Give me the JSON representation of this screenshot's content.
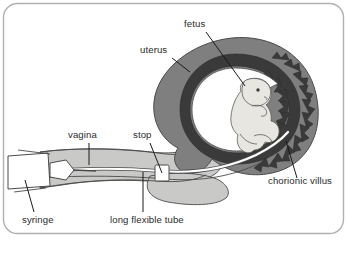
{
  "figure": {
    "frame": {
      "border_color": "#b0b0b0",
      "background_color": "#ffffff",
      "corner_radius": 14
    },
    "palette": {
      "uterus_wall": "#807f80",
      "inner_dark_ring": "#3a3a3a",
      "amniotic_cavity": "#ffffff",
      "fetus_fill": "#e8e6e1",
      "soft_tissue": "#c9c9c7",
      "catheter_white": "#ffffff",
      "outline": "#4a4a4a",
      "label_text": "#2b2b2b",
      "leader_line": "#1a1a1a"
    },
    "labels": [
      {
        "id": "fetus",
        "text": "fetus",
        "text_x": 184,
        "text_y": 27,
        "anchor": "start",
        "leader": {
          "x1": 206,
          "y1": 32,
          "x2": 245,
          "y2": 86
        }
      },
      {
        "id": "uterus",
        "text": "uterus",
        "text_x": 140,
        "text_y": 53,
        "anchor": "start",
        "leader": {
          "x1": 172,
          "y1": 58,
          "x2": 190,
          "y2": 72
        }
      },
      {
        "id": "vagina",
        "text": "vagina",
        "text_x": 68,
        "text_y": 138,
        "anchor": "start",
        "leader": {
          "x1": 89,
          "y1": 143,
          "x2": 89,
          "y2": 165
        }
      },
      {
        "id": "stop",
        "text": "stop",
        "text_x": 133,
        "text_y": 138,
        "anchor": "start",
        "leader": {
          "x1": 150,
          "y1": 143,
          "x2": 162,
          "y2": 173
        }
      },
      {
        "id": "chorionic-villus",
        "text": "chorionic villus",
        "text_x": 268,
        "text_y": 184,
        "anchor": "start",
        "leader": {
          "x1": 297,
          "y1": 178,
          "x2": 286,
          "y2": 141
        }
      },
      {
        "id": "syringe",
        "text": "syringe",
        "text_x": 22,
        "text_y": 223,
        "anchor": "start",
        "leader": {
          "x1": 34,
          "y1": 212,
          "x2": 25,
          "y2": 180
        }
      },
      {
        "id": "long-flexible-tube",
        "text": "long flexible tube",
        "text_x": 110,
        "text_y": 223,
        "anchor": "start",
        "leader": {
          "x1": 143,
          "y1": 212,
          "x2": 143,
          "y2": 172
        }
      }
    ],
    "parts": [
      {
        "id": "uterus-wall",
        "name": "uterus-wall"
      },
      {
        "id": "chorion-ring",
        "name": "chorion-ring"
      },
      {
        "id": "chorionic-villi-spikes",
        "name": "chorionic-villi-spikes"
      },
      {
        "id": "amniotic-cavity",
        "name": "amniotic-cavity"
      },
      {
        "id": "fetus-body",
        "name": "fetus-body"
      },
      {
        "id": "cervix-vagina-canal",
        "name": "cervix-vagina-canal"
      },
      {
        "id": "catheter-tube",
        "name": "catheter-tube"
      },
      {
        "id": "stop-marker",
        "name": "stop-marker"
      },
      {
        "id": "syringe-barrel",
        "name": "syringe-barrel"
      },
      {
        "id": "syringe-plunger",
        "name": "syringe-plunger"
      }
    ]
  }
}
